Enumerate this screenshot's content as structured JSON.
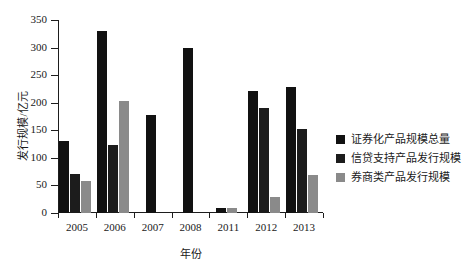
{
  "chart_data": {
    "type": "bar",
    "title": "",
    "subtitle": "",
    "xlabel": "年份",
    "ylabel": "发行规模/亿元",
    "categories": [
      "2005",
      "2006",
      "2007",
      "2008",
      "2011",
      "2012",
      "2013"
    ],
    "ylim": [
      0,
      350
    ],
    "yticks": [
      0,
      50,
      100,
      150,
      200,
      250,
      300,
      350
    ],
    "ytick_labels": [
      "0",
      "50",
      "100",
      "150",
      "200",
      "250",
      "300",
      "350"
    ],
    "grid": false,
    "legend_position": "right",
    "series": [
      {
        "name": "证券化产品规模总量",
        "color": "#111111",
        "values": [
          130,
          330,
          178,
          300,
          10,
          221,
          229
        ]
      },
      {
        "name": "信贷支持产品发行规模",
        "color": "#1c1c1c",
        "values": [
          71,
          123,
          null,
          null,
          null,
          190,
          153
        ]
      },
      {
        "name": "券商类产品发行规模",
        "color": "#8a8a8a",
        "values": [
          58,
          204,
          null,
          null,
          9,
          29,
          69
        ]
      }
    ]
  },
  "legend": {
    "items": [
      {
        "label": "证券化产品规模总量",
        "color": "#111111"
      },
      {
        "label": "信贷支持产品发行规模",
        "color": "#1c1c1c"
      },
      {
        "label": "券商类产品发行规模",
        "color": "#8a8a8a"
      }
    ]
  }
}
